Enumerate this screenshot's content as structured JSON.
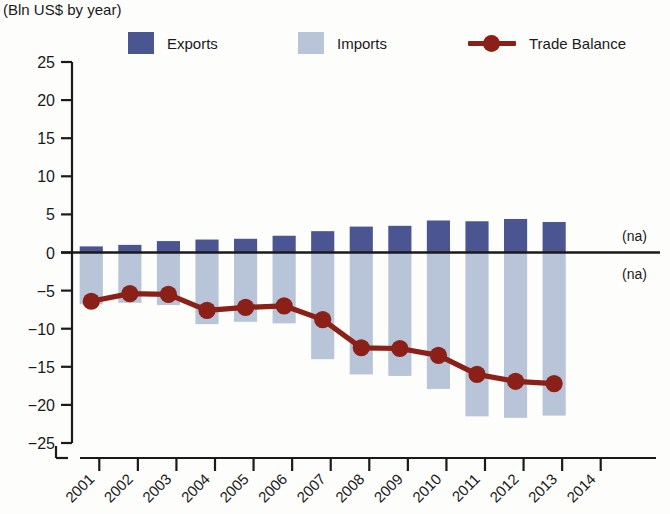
{
  "chart_data": {
    "type": "bar",
    "title": "",
    "subtitle": "(Bln US$ by year)",
    "xlabel": "",
    "ylabel": "",
    "categories": [
      "2001",
      "2002",
      "2003",
      "2004",
      "2005",
      "2006",
      "2007",
      "2008",
      "2009",
      "2010",
      "2011",
      "2012",
      "2013",
      "2014"
    ],
    "ylim": [
      -25,
      25
    ],
    "ytick_labels": [
      "25",
      "20",
      "15",
      "10",
      "5",
      "0",
      "−5",
      "−10",
      "−15",
      "−20",
      "−25"
    ],
    "ytick_values": [
      25,
      20,
      15,
      10,
      5,
      0,
      -5,
      -10,
      -15,
      -20,
      -25
    ],
    "grid": false,
    "legend_position": "top",
    "series": [
      {
        "name": "Exports",
        "kind": "bar",
        "color": "#4a5591",
        "values": [
          0.8,
          1.0,
          1.5,
          1.7,
          1.8,
          2.2,
          2.8,
          3.4,
          3.5,
          4.2,
          4.1,
          4.4,
          4.0,
          null
        ]
      },
      {
        "name": "Imports",
        "kind": "bar",
        "color": "#b8c4d8",
        "values": [
          -6.8,
          -6.6,
          -6.9,
          -9.4,
          -9.1,
          -9.3,
          -14.0,
          -16.0,
          -16.2,
          -17.9,
          -21.5,
          -21.7,
          -21.4,
          null
        ]
      },
      {
        "name": "Trade Balance",
        "kind": "line",
        "color": "#8b2018",
        "values": [
          -6.4,
          -5.4,
          -5.5,
          -7.6,
          -7.2,
          -7.0,
          -8.8,
          -12.5,
          -12.6,
          -13.5,
          -16.0,
          -16.9,
          -17.2,
          null
        ]
      }
    ],
    "annotations": [
      {
        "name": "exports-na",
        "text": "(na)",
        "x": "2014",
        "position": "above-axis"
      },
      {
        "name": "imports-na",
        "text": "(na)",
        "x": "2014",
        "position": "below-axis"
      }
    ]
  },
  "legend": {
    "items": [
      {
        "label": "Exports",
        "color": "#4a5591",
        "marker": "square"
      },
      {
        "label": "Imports",
        "color": "#b8c4d8",
        "marker": "square"
      },
      {
        "label": "Trade Balance",
        "color": "#8b2018",
        "marker": "line-dot"
      }
    ]
  }
}
